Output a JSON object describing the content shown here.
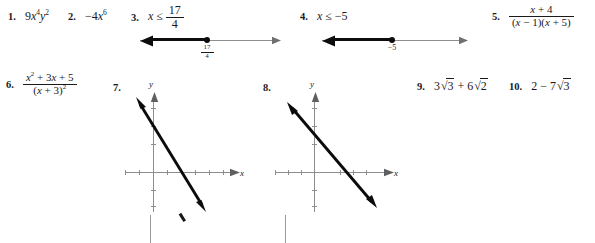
{
  "page": {
    "kind": "answer-key-excerpt",
    "width": 595,
    "height": 243,
    "ink_color": "#1a1a1a",
    "axis_color": "#8d8d8d"
  },
  "items": [
    {
      "number": "1.",
      "type": "expression",
      "answer_plain": "9x^4y^2",
      "parts": {
        "coef": "9",
        "v1": "x",
        "e1": "4",
        "v2": "y",
        "e2": "2"
      }
    },
    {
      "number": "2.",
      "type": "expression",
      "answer_plain": "-4x^6",
      "parts": {
        "sign": "−",
        "coef": "4",
        "v1": "x",
        "e1": "6"
      }
    },
    {
      "number": "3.",
      "type": "inequality-with-numberline",
      "answer_plain": "x ≤ 17/4",
      "parts": {
        "var": "x",
        "rel": "≤",
        "num": "17",
        "den": "4"
      },
      "numberline": {
        "point_label_num": "17",
        "point_label_den": "4",
        "direction": "left",
        "endpoint": "closed"
      }
    },
    {
      "number": "4.",
      "type": "inequality-with-numberline",
      "answer_plain": "x ≤ -5",
      "parts": {
        "var": "x",
        "rel": "≤",
        "value": "−5"
      },
      "numberline": {
        "point_label": "−5",
        "direction": "left",
        "endpoint": "closed"
      }
    },
    {
      "number": "5.",
      "type": "rational-expression",
      "answer_plain": "(x + 4)/((x - 1)(x + 5))",
      "parts": {
        "numerator": {
          "v": "x",
          "op": "+",
          "c": "4"
        },
        "denominator": {
          "f1v": "x",
          "f1op": "−",
          "f1c": "1",
          "f2v": "x",
          "f2op": "+",
          "f2c": "5"
        }
      }
    },
    {
      "number": "6.",
      "type": "rational-expression",
      "answer_plain": "(x^2 + 3x + 5)/((x + 3)^2)",
      "parts": {
        "numerator": {
          "v": "x",
          "e": "2",
          "op1": "+",
          "c1": "3",
          "v2": "x",
          "op2": "+",
          "c2": "5"
        },
        "denominator": {
          "v": "x",
          "op": "+",
          "c": "3",
          "exp": "2"
        }
      }
    },
    {
      "number": "7.",
      "type": "coordinate-graph",
      "graph": {
        "xlabel": "x",
        "ylabel": "y",
        "x_ticks": 7,
        "y_ticks": 6,
        "line": {
          "description": "steep negative slope line with arrowheads both ends",
          "slope": -3.0,
          "x_intercept": 0.4
        }
      }
    },
    {
      "number": "8.",
      "type": "coordinate-graph",
      "graph": {
        "xlabel": "x",
        "ylabel": "y",
        "x_ticks": 7,
        "y_ticks": 6,
        "line": {
          "description": "negative slope line with arrowheads both ends",
          "slope": -1.2,
          "x_intercept": 0.5
        }
      }
    },
    {
      "number": "9.",
      "type": "radical-expression",
      "answer_plain": "3√3 + 6√2",
      "parts": {
        "c1": "3",
        "r1": "3",
        "op": "+",
        "c2": "6",
        "r2": "2"
      }
    },
    {
      "number": "10.",
      "type": "radical-expression",
      "answer_plain": "2 − 7√3",
      "parts": {
        "c1": "2",
        "op": "−",
        "c2": "7",
        "r2": "3"
      }
    }
  ],
  "glyphs": {
    "radical": "√",
    "leq": "≤",
    "minus": "−",
    "plus": "+"
  }
}
